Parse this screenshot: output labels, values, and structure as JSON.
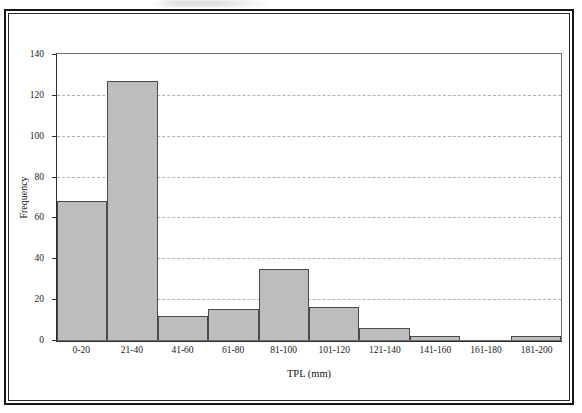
{
  "chart_data": {
    "type": "bar",
    "title": "",
    "xlabel": "TPL (mm)",
    "ylabel": "Frequency",
    "categories": [
      "0-20",
      "21-40",
      "41-60",
      "61-80",
      "81-100",
      "101-120",
      "121-140",
      "141-160",
      "161-180",
      "181-200"
    ],
    "values": [
      68,
      127,
      12,
      15,
      35,
      16,
      6,
      2,
      0,
      2
    ],
    "ylim": [
      0,
      140
    ],
    "yticks": [
      0,
      20,
      40,
      60,
      80,
      100,
      120,
      140
    ],
    "ytick_labels": [
      "0",
      "20",
      "40",
      "60",
      "80",
      "100",
      "120",
      "140"
    ],
    "grid": "horizontal-dashed",
    "legend": "none",
    "bar_fill_color": "#bdbdbd",
    "bar_edge_color": "#4a4a4a",
    "gridline_color": "#9aa7b4",
    "axis_color": "#2d2d2d",
    "frame_color": "#151515"
  }
}
